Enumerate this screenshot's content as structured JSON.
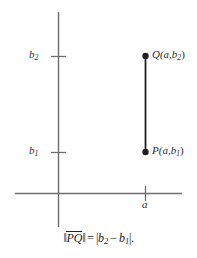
{
  "figure": {
    "type": "coordinate-plane-diagram",
    "axis_color": "#6e6e6e",
    "ink_color": "#1f1f1f",
    "text_color": "#2b2b2b",
    "axes": {
      "x_axis_label": "",
      "y_axis_label": "",
      "x_axis_y_px": 193,
      "y_axis_x_px": 58
    },
    "y_ticks": [
      {
        "id": "b2",
        "base": "b",
        "sub": "2",
        "y_px": 56
      },
      {
        "id": "b1",
        "base": "b",
        "sub": "1",
        "y_px": 152
      }
    ],
    "x_ticks": [
      {
        "id": "a",
        "base": "a",
        "sub": "",
        "x_px": 145
      }
    ],
    "points": [
      {
        "id": "Q",
        "name": "Q",
        "label": "Q(a,b2)",
        "label_base": "Q(",
        "label_x": "a",
        "label_comma": ",",
        "label_y_base": "b",
        "label_y_sub": "2",
        "label_close": ")",
        "x_px": 145,
        "y_px": 56
      },
      {
        "id": "P",
        "name": "P",
        "label": "P(a,b1)",
        "label_base": "P(",
        "label_x": "a",
        "label_comma": ",",
        "label_y_base": "b",
        "label_y_sub": "1",
        "label_close": ")",
        "x_px": 145,
        "y_px": 152
      }
    ],
    "segment": {
      "name": "PQ",
      "from": "P",
      "to": "Q",
      "x_px": 145,
      "y1_px": 56,
      "y2_px": 152
    }
  },
  "caption": {
    "full_text": "‖PQ‖ = |b2 − b1|.",
    "norm_open": "‖",
    "segment_label": "PQ",
    "norm_close": "‖",
    "equals": "=",
    "abs_open": "|",
    "term1_base": "b",
    "term1_sub": "2",
    "minus": "−",
    "term2_base": "b",
    "term2_sub": "1",
    "abs_close": "|",
    "period": "."
  },
  "labels": {
    "b2_base": "b",
    "b2_sub": "2",
    "b1_base": "b",
    "b1_sub": "1",
    "a": "a"
  }
}
